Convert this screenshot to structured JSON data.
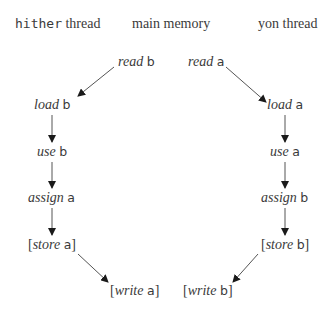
{
  "headers": {
    "hither": {
      "code": "hither",
      "text": " thread"
    },
    "main": {
      "text": "main memory"
    },
    "yon": {
      "text": "yon thread"
    }
  },
  "nodes": {
    "read_b": {
      "prefix": "",
      "op": "read",
      "var": "b",
      "suffix": ""
    },
    "read_a": {
      "prefix": "",
      "op": "read",
      "var": "a",
      "suffix": ""
    },
    "load_b": {
      "prefix": "",
      "op": "load",
      "var": "b",
      "suffix": ""
    },
    "load_a": {
      "prefix": "",
      "op": "load",
      "var": "a",
      "suffix": ""
    },
    "use_b": {
      "prefix": "",
      "op": "use",
      "var": "b",
      "suffix": ""
    },
    "use_a": {
      "prefix": "",
      "op": "use",
      "var": "a",
      "suffix": ""
    },
    "assign_a": {
      "prefix": "",
      "op": "assign",
      "var": "a",
      "suffix": ""
    },
    "assign_b": {
      "prefix": "",
      "op": "assign",
      "var": "b",
      "suffix": ""
    },
    "store_a": {
      "prefix": "[",
      "op": "store",
      "var": "a",
      "suffix": "]"
    },
    "store_b": {
      "prefix": "[",
      "op": "store",
      "var": "b",
      "suffix": "]"
    },
    "write_a": {
      "prefix": "[",
      "op": "write",
      "var": "a",
      "suffix": "]"
    },
    "write_b": {
      "prefix": "[",
      "op": "write",
      "var": "b",
      "suffix": "]"
    }
  },
  "edges": [
    {
      "from": "read b",
      "to": "load b"
    },
    {
      "from": "load b",
      "to": "use b"
    },
    {
      "from": "use b",
      "to": "assign a"
    },
    {
      "from": "assign a",
      "to": "store a"
    },
    {
      "from": "store a",
      "to": "write a"
    },
    {
      "from": "read a",
      "to": "load a"
    },
    {
      "from": "load a",
      "to": "use a"
    },
    {
      "from": "use a",
      "to": "assign b"
    },
    {
      "from": "assign b",
      "to": "store b"
    },
    {
      "from": "store b",
      "to": "write b"
    }
  ],
  "colors": {
    "text": "#3a3a3a",
    "arrow": "#555555",
    "arrowhead": "#1a1a1a"
  }
}
